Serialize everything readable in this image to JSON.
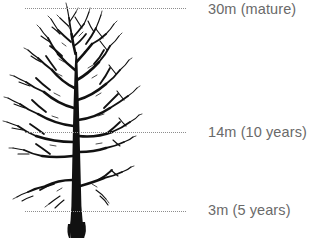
{
  "diagram": {
    "background_color": "#ffffff",
    "illustration": {
      "name": "bare-deciduous-tree",
      "color": "#111111",
      "description": "Black silhouette of a bare broadleaf tree with dense branching canopy and thick straight trunk"
    },
    "line_color": "#8d8d8d",
    "label_color": "#6a6a6a",
    "markers": [
      {
        "id": "mature",
        "label": "30m (mature)",
        "height_m": 30,
        "stage": "mature",
        "y": 8,
        "line_start_x": 25,
        "line_end_x": 186,
        "label_x": 208
      },
      {
        "id": "ten-years",
        "label": "14m (10 years)",
        "height_m": 14,
        "stage": "10 years",
        "y": 132,
        "line_start_x": 25,
        "line_end_x": 186,
        "label_x": 208
      },
      {
        "id": "five-years",
        "label": "3m (5 years)",
        "height_m": 3,
        "stage": "5 years",
        "y": 211,
        "line_start_x": 25,
        "line_end_x": 186,
        "label_x": 208
      }
    ]
  }
}
